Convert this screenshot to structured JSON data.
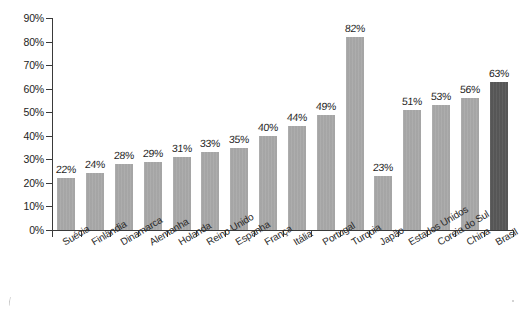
{
  "chart_data": {
    "type": "bar",
    "title": "",
    "xlabel": "",
    "ylabel": "",
    "ylim": [
      0,
      90
    ],
    "ytick_step": 10,
    "ytick_labels": [
      "0%",
      "10%",
      "20%",
      "30%",
      "40%",
      "50%",
      "60%",
      "70%",
      "80%",
      "90%"
    ],
    "ytick_values": [
      0,
      10,
      20,
      30,
      40,
      50,
      60,
      70,
      80,
      90
    ],
    "grid": false,
    "legend": null,
    "value_label_suffix": "%",
    "categories": [
      "Suécia",
      "Finlândia",
      "Dinamarca",
      "Alemanha",
      "Holanda",
      "Reino Unido",
      "Espanha",
      "França",
      "Itália",
      "Portugal",
      "Turquia",
      "Japão",
      "Estados Unidos",
      "Coreia do Sul",
      "China",
      "Brasil"
    ],
    "values": [
      22,
      24,
      28,
      29,
      31,
      33,
      35,
      40,
      44,
      49,
      82,
      23,
      51,
      53,
      56,
      63
    ],
    "value_labels": [
      "22%",
      "24%",
      "28%",
      "29%",
      "31%",
      "33%",
      "35%",
      "40%",
      "44%",
      "49%",
      "82%",
      "23%",
      "51%",
      "53%",
      "56%",
      "63%"
    ],
    "highlight_index": 15,
    "colors": {
      "bar": "#a9a9a9",
      "bar_highlight": "#585858",
      "axis": "#3a3a3a",
      "text": "#232323",
      "background": "#ffffff"
    }
  }
}
